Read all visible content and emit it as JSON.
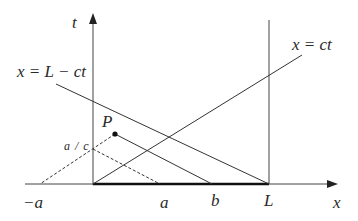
{
  "diagram": {
    "type": "spacetime characteristic diagram",
    "axes": {
      "horizontal_label": "x",
      "vertical_label": "t"
    },
    "lines": {
      "right_moving": "x = ct",
      "left_moving": "x = L − ct"
    },
    "point": {
      "label": "P"
    },
    "tick_labels": {
      "minus_a": "−a",
      "a": "a",
      "b": "b",
      "L": "L",
      "a_over_c": "a / c"
    },
    "colors": {
      "line": "#333333",
      "thick_segment": "#111111",
      "background": "#ffffff"
    }
  }
}
